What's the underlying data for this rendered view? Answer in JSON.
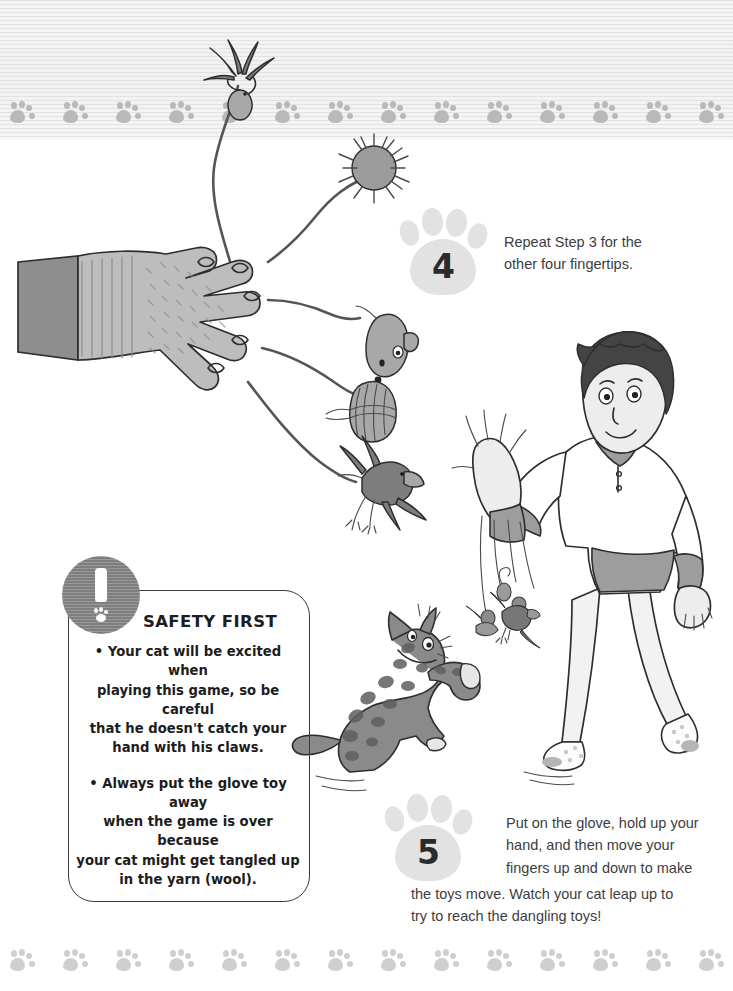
{
  "page": {
    "background_color": "#ffffff",
    "band_color": "#f0f0f0",
    "paw_color": "#b9b9b9",
    "ink_color": "#2e2e2e"
  },
  "decor": {
    "top_border": {
      "name": "paw-print-border",
      "paw_count": 17,
      "color": "#b9b9b9"
    },
    "bottom_border": {
      "name": "paw-print-border",
      "paw_count": 17,
      "color": "#cfcfcf"
    }
  },
  "steps": [
    {
      "number": "4",
      "badge_icon": "paw-print-icon",
      "text": "Repeat Step 3 for the other four fingertips."
    },
    {
      "number": "5",
      "badge_icon": "paw-print-icon",
      "text": "Put on the glove, hold up your hand, and then move your fingers up and down to make the toys move. Watch your cat leap up to try to reach the dangling toys!"
    }
  ],
  "step4_lines": [
    "Repeat Step 3 for the",
    "other four fingertips."
  ],
  "step5_lines": [
    "Put on the glove, hold up your",
    "hand, and then move your",
    "fingers up and down to make",
    "the toys move. Watch your cat leap up to",
    "try to reach the dangling toys!"
  ],
  "safety": {
    "icon": "exclamation-paw-icon",
    "title": "SAFETY FIRST",
    "bullets": [
      "• Your cat will be excited when playing this game, so be careful that he doesn't catch your hand with his claws.",
      "• Always put the glove toy away when the game is over because your cat might get tangled up in the yarn (wool)."
    ],
    "bullet1_lines": [
      "• Your cat will be excited when",
      "playing this game, so be careful",
      "that he doesn't catch your",
      "hand with his claws."
    ],
    "bullet2_lines": [
      "• Always put the glove toy away",
      "when the game is over because",
      "your cat might get tangled up",
      "in the yarn (wool)."
    ]
  },
  "illustration": {
    "glove": {
      "name": "knit-glove-illustration",
      "color": "#bdbdbd",
      "cuff_color": "#8e8e8e"
    },
    "toys": [
      {
        "name": "feather-toy-icon"
      },
      {
        "name": "pompom-toy-icon"
      },
      {
        "name": "mouse-toy-icon"
      },
      {
        "name": "yarn-ball-toy-icon"
      },
      {
        "name": "bird-toy-icon"
      }
    ],
    "boy": {
      "name": "boy-illustration",
      "hair_color": "#444444",
      "shirt_color": "#ffffff",
      "accent_color": "#9d9d9d"
    },
    "cat": {
      "name": "cat-illustration",
      "body_color": "#8a8a8a",
      "spot_color": "#5f5f5f"
    }
  }
}
